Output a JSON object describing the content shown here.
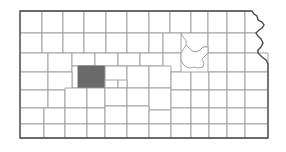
{
  "map": {
    "title": "Kansas",
    "subject": "Kansas county locator map",
    "caption": "Map of Kansas showing all counties with one county shaded",
    "highlighted_county": "Scott",
    "highlighted_region": "west-central Kansas",
    "county_count": 105,
    "colors": {
      "background": "#ffffff",
      "county_fill": "#ffffff",
      "county_border": "#9a9a9a",
      "state_border": "#4a4a4a",
      "highlight_fill": "#6a6a6a"
    },
    "bounds": {
      "left": 20,
      "top": 11,
      "right": 268,
      "bottom": 138,
      "image_width": 286,
      "image_height": 152
    },
    "legend": {
      "visible": false,
      "labels": []
    },
    "labels": {
      "visible": false,
      "county_names_shown": false,
      "title_shown": false
    }
  }
}
